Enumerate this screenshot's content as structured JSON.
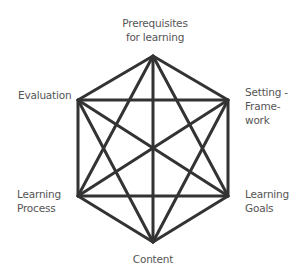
{
  "diagram": {
    "type": "hexagon-complete-graph",
    "line_color": "#333333",
    "text_color": "#555555",
    "nodes": {
      "top": {
        "line1": "Prerequisites",
        "line2": "for learning"
      },
      "upper_left": {
        "line1": "Evaluation"
      },
      "upper_right": {
        "line1": "Setting -",
        "line2": "Frame-",
        "line3": "work"
      },
      "lower_left": {
        "line1": "Learning",
        "line2": "Process"
      },
      "lower_right": {
        "line1": "Learning",
        "line2": "Goals"
      },
      "bottom": {
        "line1": "Content"
      }
    }
  }
}
